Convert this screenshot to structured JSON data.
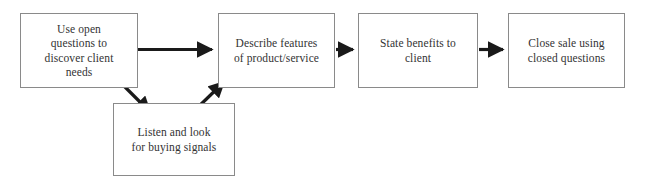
{
  "diagram": {
    "type": "flowchart",
    "orientation": "left-to-right",
    "colors": {
      "box_border": "#8a8a8a",
      "box_fill": "#ffffff",
      "text": "#333333",
      "arrow": "#1a1a1a",
      "background": "#ffffff"
    },
    "nodes": [
      {
        "id": "discover",
        "label": "Use open\nquestions to\ndiscover client\nneeds",
        "shape": "rectangle"
      },
      {
        "id": "describe",
        "label": "Describe features\nof product/service",
        "shape": "rectangle"
      },
      {
        "id": "benefits",
        "label": "State benefits to\nclient",
        "shape": "rectangle"
      },
      {
        "id": "close",
        "label": "Close sale using\nclosed questions",
        "shape": "rectangle"
      },
      {
        "id": "listen",
        "label": "Listen and look\nfor buying signals",
        "shape": "rectangle"
      }
    ],
    "edges": [
      {
        "id": "discover-to-describe",
        "from": "discover",
        "to": "describe",
        "style": "solid-arrow",
        "direction": "horizontal"
      },
      {
        "id": "describe-to-benefits",
        "from": "describe",
        "to": "benefits",
        "style": "solid-arrow",
        "direction": "horizontal"
      },
      {
        "id": "benefits-to-close",
        "from": "benefits",
        "to": "close",
        "style": "solid-arrow",
        "direction": "horizontal"
      },
      {
        "id": "discover-to-listen",
        "from": "discover",
        "to": "listen",
        "style": "solid-arrow",
        "direction": "diagonal-down-right"
      },
      {
        "id": "listen-to-describe",
        "from": "listen",
        "to": "describe",
        "style": "solid-arrow",
        "direction": "diagonal-up-right"
      }
    ]
  }
}
